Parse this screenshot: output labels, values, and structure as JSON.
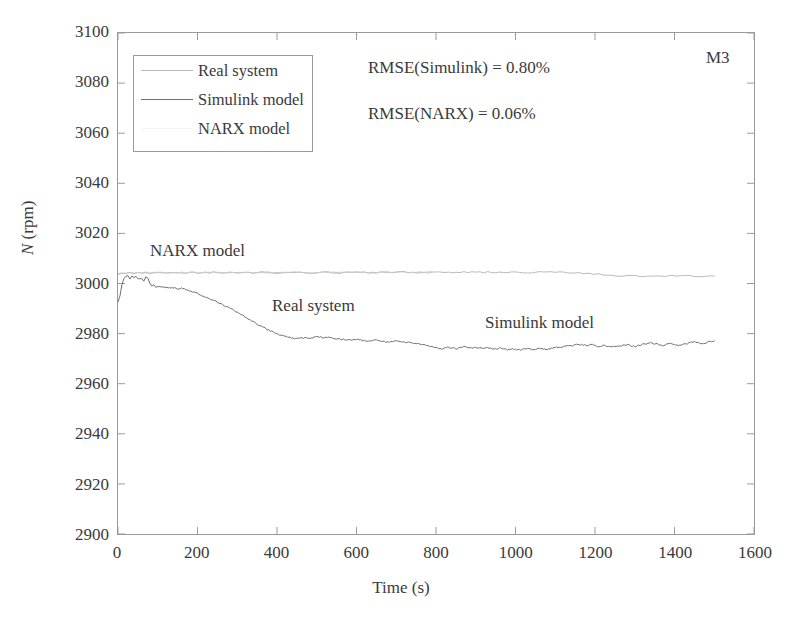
{
  "panel_id": "M3",
  "legend": {
    "items": [
      {
        "label": "Real system",
        "color": "#b9b9b9",
        "show_line": true
      },
      {
        "label": "Simulink model",
        "color": "#6e6e6e",
        "show_line": true
      },
      {
        "label": "NARX model",
        "color": "#e2e2e2",
        "show_line": false
      }
    ]
  },
  "annotations": {
    "rmse_simulink": "RMSE(Simulink) = 0.80%",
    "rmse_narx": "RMSE(NARX) = 0.06%",
    "narx_label": "NARX model",
    "real_label": "Real system",
    "simulink_label": "Simulink model"
  },
  "chart_data": {
    "type": "line",
    "title": "",
    "xlabel": "Time (s)",
    "ylabel": "N (rpm)",
    "ylabel_italic_part": "N",
    "ylabel_rest": " (rpm)",
    "xlim": [
      0,
      1600
    ],
    "ylim": [
      2900,
      3100
    ],
    "xticks": [
      0,
      200,
      400,
      600,
      800,
      1000,
      1200,
      1400,
      1600
    ],
    "yticks": [
      2900,
      2920,
      2940,
      2960,
      2980,
      3000,
      3020,
      3040,
      3060,
      3080,
      3100
    ],
    "grid": false,
    "legend_position": "upper-left-inside",
    "series": [
      {
        "name": "Real system",
        "color": "#b9b9b9",
        "width": 1,
        "x": [
          0,
          10,
          20,
          30,
          40,
          50,
          60,
          70,
          80,
          90,
          100,
          110,
          120,
          130,
          140,
          150,
          160,
          170,
          180,
          190,
          200,
          210,
          220,
          230,
          240,
          250,
          260,
          270,
          280,
          290,
          300,
          320,
          340,
          360,
          380,
          400,
          420,
          440,
          460,
          480,
          500,
          520,
          540,
          560,
          580,
          600,
          620,
          640,
          660,
          680,
          700,
          720,
          740,
          760,
          780,
          790,
          840,
          860,
          880,
          900,
          920,
          940,
          960,
          980,
          1000,
          1020,
          1040,
          1060,
          1080,
          1100,
          1120,
          1140,
          1150,
          1250,
          1270,
          1290,
          1310,
          1330,
          1350,
          1370,
          1390,
          1410,
          1430,
          1450,
          1470,
          1490,
          1500
        ],
        "y": [
          3003.5,
          3004.0,
          3004.2,
          3004.3,
          3004.1,
          3004.3,
          3004.2,
          3004.4,
          3004.1,
          3004.3,
          3004.2,
          3004.4,
          3004.2,
          3004.3,
          3004.1,
          3004.3,
          3004.4,
          3004.2,
          3004.4,
          3004.5,
          3004.3,
          3004.2,
          3004.4,
          3004.3,
          3004.5,
          3004.3,
          3004.2,
          3004.4,
          3004.3,
          3004.5,
          3004.3,
          3004.4,
          3004.2,
          3004.5,
          3004.3,
          3004.2,
          3004.4,
          3004.6,
          3004.3,
          3004.2,
          3004.4,
          3004.6,
          3004.4,
          3004.3,
          3004.5,
          3004.6,
          3004.4,
          3004.3,
          3004.5,
          3004.4,
          3004.6,
          3004.5,
          3004.3,
          3004.5,
          3004.4,
          3004.4,
          3004.5,
          3004.4,
          3004.6,
          3004.5,
          3004.4,
          3004.6,
          3004.5,
          3004.4,
          3004.6,
          3004.5,
          3004.4,
          3004.5,
          3004.4,
          3004.6,
          3004.5,
          3004.4,
          3004.4,
          3003.0,
          3002.9,
          3003.1,
          3003.0,
          3002.8,
          3003.0,
          3002.9,
          3003.1,
          3002.9,
          3003.0,
          3002.8,
          3003.0,
          3002.9,
          3002.9
        ]
      },
      {
        "name": "NARX model",
        "color": "#c8c8c8",
        "width": 1,
        "x": [
          0,
          20,
          40,
          60,
          80,
          100,
          120,
          140,
          160,
          180,
          200,
          220,
          240,
          260,
          280,
          300,
          320,
          340,
          360,
          380,
          400,
          420,
          440,
          460,
          480,
          500,
          520,
          540,
          560,
          580,
          600,
          620,
          640,
          660,
          680,
          700,
          720,
          740,
          760,
          780,
          790
        ],
        "y": [
          3003.8,
          3004.2,
          3004.3,
          3004.2,
          3004.3,
          3004.3,
          3004.2,
          3004.3,
          3004.4,
          3004.3,
          3004.4,
          3004.3,
          3004.4,
          3004.3,
          3004.4,
          3004.3,
          3004.4,
          3004.3,
          3004.5,
          3004.3,
          3004.2,
          3004.4,
          3004.5,
          3004.3,
          3004.2,
          3004.4,
          3004.5,
          3004.4,
          3004.3,
          3004.5,
          3004.6,
          3004.4,
          3004.3,
          3004.5,
          3004.4,
          3004.6,
          3004.5,
          3004.3,
          3004.5,
          3004.4,
          3004.4
        ]
      },
      {
        "name": "Simulink model",
        "color": "#6e6e6e",
        "width": 1,
        "x": [
          0,
          5,
          10,
          15,
          20,
          25,
          30,
          35,
          40,
          45,
          50,
          55,
          60,
          65,
          70,
          75,
          80,
          85,
          90,
          95,
          100,
          105,
          110,
          115,
          120,
          130,
          140,
          150,
          160,
          170,
          180,
          190,
          200,
          210,
          220,
          230,
          240,
          250,
          260,
          270,
          280,
          290,
          300,
          310,
          320,
          330,
          340,
          350,
          360,
          370,
          380,
          390,
          400,
          410,
          420,
          430,
          440,
          450,
          460,
          470,
          480,
          490,
          500,
          510,
          520,
          530,
          540,
          550,
          560,
          570,
          580,
          590,
          600,
          610,
          620,
          630,
          640,
          650,
          660,
          670,
          680,
          690,
          700,
          710,
          720,
          730,
          740,
          750,
          760,
          770,
          780,
          790,
          800,
          810,
          820,
          830,
          840,
          850,
          860,
          870,
          880,
          890,
          900,
          910,
          920,
          930,
          940,
          950,
          960,
          970,
          980,
          990,
          1000,
          1010,
          1020,
          1030,
          1040,
          1050,
          1060,
          1070,
          1080,
          1090,
          1100,
          1110,
          1120,
          1130,
          1140,
          1150,
          1160,
          1170,
          1180,
          1190,
          1200,
          1210,
          1220,
          1230,
          1240,
          1250,
          1260,
          1270,
          1280,
          1290,
          1300,
          1310,
          1320,
          1330,
          1340,
          1350,
          1360,
          1370,
          1380,
          1390,
          1400,
          1410,
          1420,
          1430,
          1440,
          1450,
          1460,
          1470,
          1480,
          1490,
          1500
        ],
        "y": [
          2992.5,
          2995.0,
          2999.5,
          3002.0,
          3003.0,
          3003.2,
          3002.0,
          3003.0,
          3002.4,
          3003.0,
          3002.2,
          3001.6,
          3002.0,
          3001.0,
          3002.4,
          3002.0,
          3000.2,
          2999.0,
          2999.5,
          2998.6,
          2998.8,
          2998.6,
          2998.4,
          2998.3,
          2998.4,
          2998.2,
          2998.4,
          2998.0,
          2998.2,
          2997.6,
          2997.0,
          2996.6,
          2996.0,
          2995.4,
          2994.6,
          2994.0,
          2993.4,
          2992.6,
          2991.8,
          2991.0,
          2990.4,
          2989.4,
          2988.4,
          2987.6,
          2986.6,
          2985.6,
          2984.8,
          2983.8,
          2983.0,
          2982.2,
          2981.4,
          2980.6,
          2980.0,
          2979.4,
          2979.0,
          2978.6,
          2978.2,
          2978.0,
          2978.4,
          2978.2,
          2978.0,
          2978.4,
          2978.8,
          2978.6,
          2978.4,
          2978.6,
          2978.2,
          2978.0,
          2977.8,
          2977.6,
          2977.4,
          2977.6,
          2977.8,
          2977.4,
          2977.2,
          2977.0,
          2977.2,
          2977.4,
          2977.0,
          2976.8,
          2976.6,
          2976.8,
          2977.0,
          2976.8,
          2976.6,
          2976.4,
          2976.2,
          2976.0,
          2975.8,
          2975.6,
          2975.2,
          2974.8,
          2974.4,
          2974.0,
          2974.2,
          2974.6,
          2974.4,
          2974.0,
          2974.4,
          2974.8,
          2974.4,
          2974.2,
          2974.6,
          2974.2,
          2974.0,
          2974.4,
          2974.0,
          2973.8,
          2974.2,
          2973.8,
          2973.6,
          2974.0,
          2973.6,
          2973.4,
          2973.8,
          2974.0,
          2973.6,
          2973.8,
          2974.2,
          2974.0,
          2973.8,
          2974.2,
          2974.6,
          2974.4,
          2974.8,
          2975.2,
          2975.0,
          2975.4,
          2975.8,
          2975.4,
          2975.2,
          2975.6,
          2975.2,
          2974.8,
          2975.2,
          2975.0,
          2974.6,
          2975.0,
          2974.8,
          2975.2,
          2975.6,
          2975.2,
          2974.8,
          2975.2,
          2975.6,
          2976.0,
          2976.4,
          2976.0,
          2975.6,
          2975.2,
          2975.6,
          2976.0,
          2975.6,
          2975.2,
          2975.6,
          2976.0,
          2976.4,
          2976.8,
          2976.4,
          2976.0,
          2976.4,
          2976.8,
          2977.0
        ]
      }
    ]
  }
}
